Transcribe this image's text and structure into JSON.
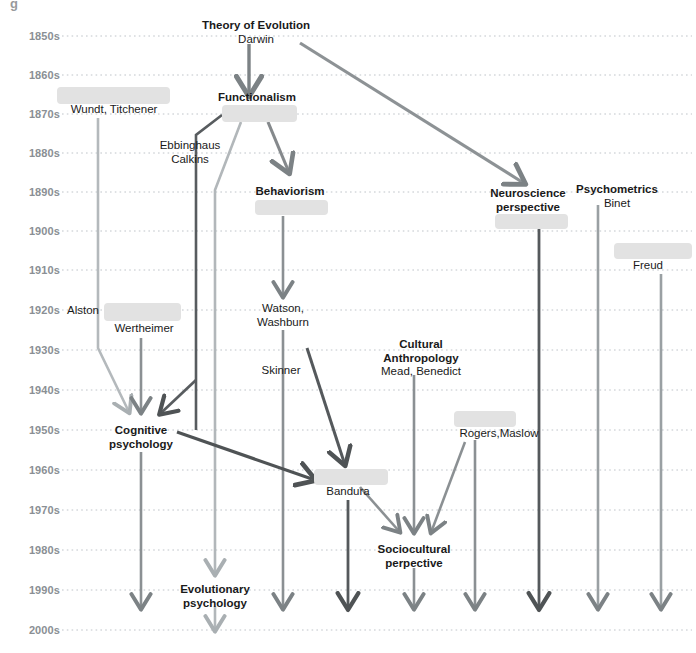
{
  "diagram": {
    "title_fragment": "g",
    "type": "timeline-flow",
    "width": 696,
    "height": 653,
    "colors": {
      "grid": "#bfc4c9",
      "year_label": "#8a8f94",
      "redaction": "#e2e2e2",
      "arrow_dark": "#4f5355",
      "arrow_mid": "#7c8285",
      "arrow_light": "#a9afb2",
      "text": "#1a1a1a"
    }
  },
  "axis": {
    "label": "Decades",
    "ticks": [
      {
        "label": "1850s",
        "y": 36
      },
      {
        "label": "1860s",
        "y": 75
      },
      {
        "label": "1870s",
        "y": 114
      },
      {
        "label": "1880s",
        "y": 153
      },
      {
        "label": "1890s",
        "y": 192
      },
      {
        "label": "1900s",
        "y": 231
      },
      {
        "label": "1910s",
        "y": 270
      },
      {
        "label": "1920s",
        "y": 310
      },
      {
        "label": "1930s",
        "y": 350
      },
      {
        "label": "1940s",
        "y": 390
      },
      {
        "label": "1950s",
        "y": 430
      },
      {
        "label": "1960s",
        "y": 470
      },
      {
        "label": "1970s",
        "y": 510
      },
      {
        "label": "1980s",
        "y": 550
      },
      {
        "label": "1990s",
        "y": 590
      },
      {
        "label": "2000s",
        "y": 630
      }
    ]
  },
  "nodes": [
    {
      "id": "theory-of-evolution",
      "title": "Theory of Evolution",
      "people": "Darwin",
      "x": 256,
      "y": 32,
      "bold": true
    },
    {
      "id": "functionalism",
      "title": "Functionalism",
      "people": "",
      "x": 257,
      "y": 98,
      "bold": true
    },
    {
      "id": "wundt-titchener",
      "title": "",
      "people": "Wundt, Titchener",
      "x": 114,
      "y": 110,
      "bold": false
    },
    {
      "id": "ebbinghaus-calkins",
      "title": "",
      "people": "Ebbinghaus\nCalkins",
      "x": 190,
      "y": 152,
      "bold": false
    },
    {
      "id": "behaviorism",
      "title": "Behaviorism",
      "people": "",
      "x": 290,
      "y": 192,
      "bold": true
    },
    {
      "id": "neuroscience-perspective",
      "title": "Neuroscience\nperspective",
      "people": "",
      "x": 528,
      "y": 200,
      "bold": true
    },
    {
      "id": "psychometrics",
      "title": "Psychometrics",
      "people": "Binet",
      "x": 617,
      "y": 196,
      "bold": true
    },
    {
      "id": "freud",
      "title": "",
      "people": "Freud",
      "x": 648,
      "y": 266,
      "bold": false
    },
    {
      "id": "alston",
      "title": "",
      "people": "Alston",
      "x": 83,
      "y": 311,
      "bold": false
    },
    {
      "id": "wertheimer",
      "title": "",
      "people": "Wertheimer",
      "x": 144,
      "y": 329,
      "bold": false
    },
    {
      "id": "watson-washburn",
      "title": "",
      "people": "Watson,\nWashburn",
      "x": 283,
      "y": 315,
      "bold": false
    },
    {
      "id": "cultural-anthropology",
      "title": "Cultural\nAnthropology",
      "people": "Mead, Benedict",
      "x": 421,
      "y": 358,
      "bold": true
    },
    {
      "id": "skinner",
      "title": "",
      "people": "Skinner",
      "x": 281,
      "y": 371,
      "bold": false
    },
    {
      "id": "rogers-maslow",
      "title": "",
      "people": "Rogers,Maslow",
      "x": 499,
      "y": 434,
      "bold": false
    },
    {
      "id": "cognitive-psychology",
      "title": "Cognitive\npsychology",
      "people": "",
      "x": 141,
      "y": 437,
      "bold": true
    },
    {
      "id": "bandura",
      "title": "",
      "people": "Bandura",
      "x": 348,
      "y": 492,
      "bold": false
    },
    {
      "id": "sociocultural-perspective",
      "title": "Sociocultural\nperpective",
      "people": "",
      "x": 414,
      "y": 556,
      "bold": true
    },
    {
      "id": "evolutionary-psychology",
      "title": "Evolutionary\npsychology",
      "people": "",
      "x": 215,
      "y": 596,
      "bold": true
    }
  ],
  "redactions": [
    {
      "id": "redact-wundt",
      "x": 57,
      "y": 87,
      "w": 113,
      "h": 17
    },
    {
      "id": "redact-functionalism",
      "x": 222,
      "y": 105,
      "w": 75,
      "h": 17
    },
    {
      "id": "redact-behaviorism",
      "x": 255,
      "y": 200,
      "w": 73,
      "h": 15
    },
    {
      "id": "redact-neuroscience",
      "x": 495,
      "y": 214,
      "w": 73,
      "h": 15
    },
    {
      "id": "redact-freud",
      "x": 614,
      "y": 243,
      "w": 78,
      "h": 16
    },
    {
      "id": "redact-wertheimer",
      "x": 104,
      "y": 303,
      "w": 77,
      "h": 18
    },
    {
      "id": "redact-rogers",
      "x": 454,
      "y": 411,
      "w": 62,
      "h": 16
    },
    {
      "id": "redact-bandura",
      "x": 314,
      "y": 469,
      "w": 74,
      "h": 16
    }
  ],
  "connectors": [
    {
      "id": "evolution-to-functionalism",
      "from": "theory-of-evolution",
      "to": "functionalism",
      "tone": "mid"
    },
    {
      "id": "evolution-to-neuroscience",
      "from": "theory-of-evolution",
      "to": "neuroscience-perspective",
      "tone": "mid"
    },
    {
      "id": "functionalism-to-ebbinghaus",
      "from": "functionalism",
      "to": "ebbinghaus-calkins",
      "tone": "dark"
    },
    {
      "id": "functionalism-to-behaviorism",
      "from": "functionalism",
      "to": "behaviorism",
      "tone": "mid"
    },
    {
      "id": "functionalism-to-evolutionary",
      "from": "functionalism",
      "to": "evolutionary-psychology",
      "tone": "light"
    },
    {
      "id": "behaviorism-to-watson",
      "from": "behaviorism",
      "to": "watson-washburn",
      "tone": "mid"
    },
    {
      "id": "wundt-to-cognitive",
      "from": "wundt-titchener",
      "to": "cognitive-psychology",
      "tone": "light"
    },
    {
      "id": "wertheimer-to-cognitive",
      "from": "wertheimer",
      "to": "cognitive-psychology",
      "tone": "mid"
    },
    {
      "id": "ebbinghaus-to-cognitive",
      "from": "ebbinghaus-calkins",
      "to": "cognitive-psychology",
      "tone": "dark"
    },
    {
      "id": "skinner-to-bandura",
      "from": "skinner",
      "to": "bandura",
      "tone": "dark"
    },
    {
      "id": "cognitive-to-bandura",
      "from": "cognitive-psychology",
      "to": "bandura",
      "tone": "dark"
    },
    {
      "id": "bandura-to-sociocultural",
      "from": "bandura",
      "to": "sociocultural-perspective",
      "tone": "mid"
    },
    {
      "id": "cultural-to-sociocultural",
      "from": "cultural-anthropology",
      "to": "sociocultural-perspective",
      "tone": "mid"
    },
    {
      "id": "rogers-to-sociocultural",
      "from": "rogers-maslow",
      "to": "sociocultural-perspective",
      "tone": "mid"
    },
    {
      "id": "cognitive-to-2000s",
      "from": "cognitive-psychology",
      "to": "2000s",
      "tone": "mid"
    },
    {
      "id": "evolutionary-to-2000s",
      "from": "evolutionary-psychology",
      "to": "2000s",
      "tone": "light"
    },
    {
      "id": "behaviorism-to-2000s",
      "from": "behaviorism",
      "to": "2000s",
      "tone": "mid"
    },
    {
      "id": "bandura-to-2000s",
      "from": "bandura",
      "to": "2000s",
      "tone": "dark"
    },
    {
      "id": "sociocultural-to-2000s",
      "from": "sociocultural-perspective",
      "to": "2000s",
      "tone": "mid"
    },
    {
      "id": "rogers-to-2000s",
      "from": "rogers-maslow",
      "to": "2000s",
      "tone": "mid"
    },
    {
      "id": "neuroscience-to-2000s",
      "from": "neuroscience-perspective",
      "to": "2000s",
      "tone": "dark"
    },
    {
      "id": "psychometrics-to-2000s",
      "from": "psychometrics",
      "to": "2000s",
      "tone": "mid"
    },
    {
      "id": "freud-to-2000s",
      "from": "freud",
      "to": "2000s",
      "tone": "mid"
    }
  ]
}
